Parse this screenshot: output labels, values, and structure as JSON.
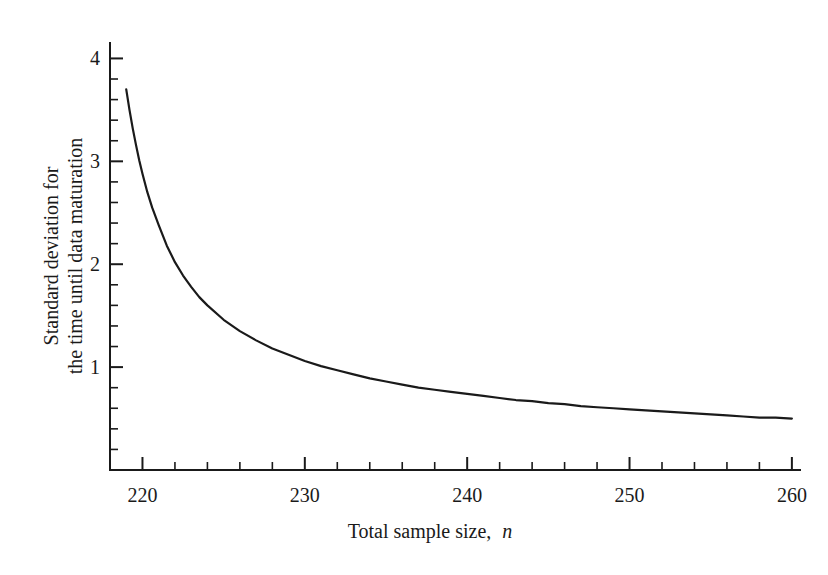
{
  "chart_data": {
    "type": "line",
    "title": "",
    "subtitle": "",
    "xlabel": "Total sample size, n",
    "xlabel_plain": "Total sample size,",
    "xlabel_symbol": "n",
    "ylabel": "Standard deviation for the time until data maturation",
    "ylabel_line1": "Standard deviation for",
    "ylabel_line2": "the time until data maturation",
    "xlim": [
      218,
      260.5
    ],
    "ylim": [
      0,
      4.15
    ],
    "grid": false,
    "legend": null,
    "legend_position": "none",
    "x_major_ticks": [
      220,
      230,
      240,
      250,
      260
    ],
    "x_major_tick_labels": [
      "220",
      "230",
      "240",
      "250",
      "260"
    ],
    "x_minor_tick_step": 2,
    "y_major_ticks": [
      1,
      2,
      3,
      4
    ],
    "y_major_tick_labels": [
      "1",
      "2",
      "3",
      "4"
    ],
    "y_minor_tick_step": 0.2,
    "axis_color": "#1a1a1a",
    "curve_color": "#1a1a1a",
    "background_color": "#ffffff",
    "series": [
      {
        "name": "standard deviation",
        "x": [
          219.0,
          219.2,
          219.4,
          219.6,
          219.8,
          220.0,
          220.3,
          220.6,
          221.0,
          221.5,
          222.0,
          222.5,
          223.0,
          223.5,
          224.0,
          225.0,
          226.0,
          227.0,
          228.0,
          229.0,
          230.0,
          231.0,
          232.0,
          233.0,
          234.0,
          235.0,
          236.0,
          237.0,
          238.0,
          239.0,
          240.0,
          241.0,
          242.0,
          243.0,
          244.0,
          245.0,
          246.0,
          247.0,
          248.0,
          249.0,
          250.0,
          251.0,
          252.0,
          253.0,
          254.0,
          255.0,
          256.0,
          257.0,
          258.0,
          259.0,
          260.0
        ],
        "y": [
          3.7,
          3.5,
          3.32,
          3.16,
          3.01,
          2.88,
          2.7,
          2.55,
          2.38,
          2.18,
          2.02,
          1.89,
          1.78,
          1.68,
          1.6,
          1.46,
          1.35,
          1.26,
          1.18,
          1.12,
          1.06,
          1.01,
          0.97,
          0.93,
          0.89,
          0.86,
          0.83,
          0.8,
          0.78,
          0.76,
          0.74,
          0.72,
          0.7,
          0.68,
          0.67,
          0.65,
          0.64,
          0.62,
          0.61,
          0.6,
          0.59,
          0.58,
          0.57,
          0.56,
          0.55,
          0.54,
          0.53,
          0.52,
          0.51,
          0.51,
          0.5
        ]
      }
    ]
  },
  "layout": {
    "plot_left_px": 110,
    "plot_right_px": 800,
    "plot_top_px": 43,
    "plot_bottom_px": 470
  }
}
